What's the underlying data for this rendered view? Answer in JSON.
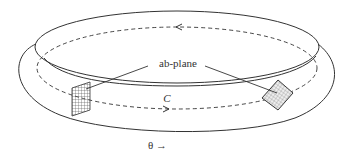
{
  "diagram": {
    "labels": {
      "plane": "ab-plane",
      "contour": "C",
      "direction": "θ →"
    },
    "colors": {
      "stroke": "#333333",
      "grid": "#555555",
      "background": "#ffffff"
    },
    "elements": [
      "torus-ring",
      "dashed-contour-C",
      "left-ab-plane-grid",
      "right-ab-plane-grid",
      "theta-direction-arrow"
    ]
  }
}
